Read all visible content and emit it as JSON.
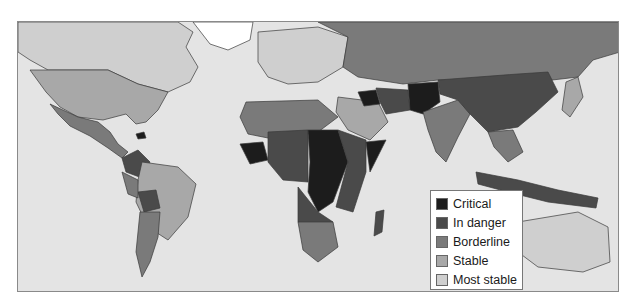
{
  "map": {
    "type": "choropleth-world-map",
    "colors": {
      "ocean": "#e4e4e4",
      "border": "#3a3a3a",
      "no_data": "#ffffff"
    }
  },
  "legend": {
    "items": [
      {
        "label": "Critical",
        "color": "#1c1c1c"
      },
      {
        "label": "In danger",
        "color": "#4a4a4a"
      },
      {
        "label": "Borderline",
        "color": "#7a7a7a"
      },
      {
        "label": "Stable",
        "color": "#a8a8a8"
      },
      {
        "label": "Most stable",
        "color": "#cfcfcf"
      }
    ]
  }
}
